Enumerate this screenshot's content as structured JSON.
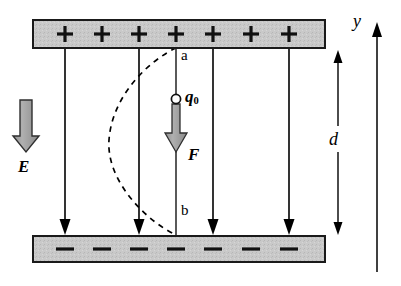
{
  "figure": {
    "width": 401,
    "height": 286,
    "background": "#ffffff"
  },
  "colors": {
    "plate_fill": "#c9c9c9",
    "plate_stroke": "#1a1a1a",
    "line": "#000000",
    "block_arrow_fill": "#9b9b9b",
    "block_arrow_stroke": "#2a2a2a",
    "charge_fill": "#ffffff",
    "charge_stroke": "#111111",
    "dashed_path": "#000000"
  },
  "plates": {
    "top": {
      "name": "positive-plate",
      "x": 33,
      "y": 20,
      "width": 292,
      "height": 28,
      "sign": "+",
      "sign_count": 7,
      "signs": [
        "+",
        "+",
        "+",
        "+",
        "+",
        "+",
        "+"
      ]
    },
    "bottom": {
      "name": "negative-plate",
      "x": 33,
      "y": 236,
      "width": 292,
      "height": 26,
      "sign": "−",
      "sign_count": 7,
      "signs": [
        "−",
        "−",
        "−",
        "−",
        "−",
        "−",
        "−"
      ]
    }
  },
  "field_lines": {
    "name": "electric-field-lines",
    "count": 5,
    "x_positions": [
      65,
      139,
      176,
      213,
      289
    ],
    "y_start": 49,
    "y_end": 235,
    "arrowheads_at": [
      65,
      139,
      213,
      289
    ],
    "direction": "downward"
  },
  "labels": {
    "E": "E",
    "F": "F",
    "q0_symbol": "q",
    "q0_subscript": "0",
    "d": "d",
    "y": "y",
    "a": "a",
    "b": "b"
  },
  "charge": {
    "name": "test-charge",
    "cx": 176,
    "cy": 99,
    "r": 4.5,
    "label": "q0"
  },
  "force_arrow": {
    "name": "force-arrow",
    "x": 176,
    "y_start": 103,
    "y_end": 152,
    "label": "F",
    "direction": "down"
  },
  "field_arrow": {
    "name": "field-arrow",
    "x": 26,
    "y_start": 100,
    "y_end": 152,
    "label": "E",
    "direction": "down"
  },
  "separation": {
    "name": "plate-separation",
    "x": 338,
    "y_top": 50,
    "y_bottom": 235,
    "label": "d",
    "arrowheads": "both"
  },
  "axis": {
    "name": "y-axis",
    "x": 377,
    "y_top": 22,
    "y_bottom": 272,
    "label": "y",
    "direction": "up"
  },
  "path": {
    "name": "dashed-trajectory",
    "start_label": "a",
    "end_label": "b",
    "start_point": [
      176,
      48
    ],
    "end_point": [
      176,
      235
    ],
    "style": "dashed",
    "bulge_direction": "left",
    "max_bulge_x": 108
  }
}
